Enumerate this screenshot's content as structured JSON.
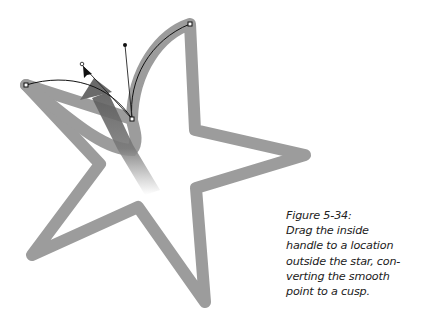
{
  "figure": {
    "label": "Figure 5-34:",
    "caption_lines": [
      "Drag the inside",
      "handle to a location",
      "outside the star, con-",
      "verting the smooth",
      "point to a cusp."
    ],
    "colors": {
      "star_outline": "#9a9a9a",
      "path": "#111111",
      "arrow": "#6a6a6a",
      "background": "#ffffff"
    },
    "icons": {
      "cursor": "arrow-pointer-icon",
      "anchor": "square-anchor-point-icon",
      "handle": "bezier-handle-dot-icon"
    }
  }
}
